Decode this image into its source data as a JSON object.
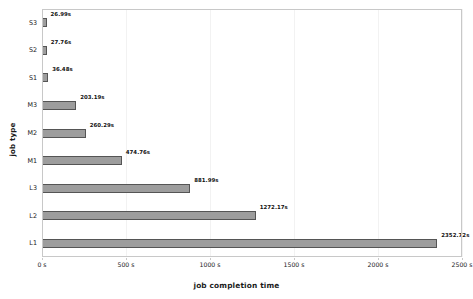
{
  "chart_data": {
    "type": "bar",
    "orientation": "horizontal",
    "title": "",
    "xlabel": "job completion time",
    "ylabel": "job type",
    "categories": [
      "S3",
      "S2",
      "S1",
      "M3",
      "M2",
      "M1",
      "L3",
      "L2",
      "L1"
    ],
    "values": [
      26.99,
      27.76,
      36.48,
      203.19,
      260.29,
      474.76,
      881.99,
      1272.17,
      2352.72
    ],
    "value_labels": [
      "26.99s",
      "27.76s",
      "36.48s",
      "203.19s",
      "260.29s",
      "474.76s",
      "881.99s",
      "1272.17s",
      "2352.72s"
    ],
    "xlim": [
      0,
      2500
    ],
    "xticks": [
      0,
      500,
      1000,
      1500,
      2000,
      2500
    ],
    "xticklabels": [
      "0 s",
      "500 s",
      "1000 s",
      "1500 s",
      "2000 s",
      "2500 s"
    ],
    "grid": true,
    "grid_axis": "x",
    "legend": "none",
    "bar_color": "#9d9d9d",
    "bar_edge_color": "#555555",
    "grid_color": "#f2f2f2",
    "axis_color": "#c8c8c8",
    "text_color": "#1a1a1a"
  }
}
